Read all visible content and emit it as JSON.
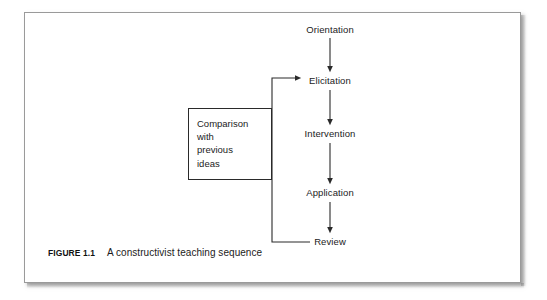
{
  "figure": {
    "caption_number": "FIGURE 1.1",
    "caption_text": "A constructivist teaching sequence",
    "frame_border_color": "#9a9a9a",
    "line_color": "#2a2a2a",
    "text_color": "#1b1b1b",
    "background_color": "#ffffff"
  },
  "diagram": {
    "type": "flowchart",
    "orientation": "vertical",
    "nodes": [
      {
        "id": "orientation",
        "label": "Orientation",
        "x": 330,
        "y": 30
      },
      {
        "id": "elicitation",
        "label": "Elicitation",
        "x": 330,
        "y": 81
      },
      {
        "id": "intervention",
        "label": "Intervention",
        "x": 330,
        "y": 134
      },
      {
        "id": "application",
        "label": "Application",
        "x": 330,
        "y": 193
      },
      {
        "id": "review",
        "label": "Review",
        "x": 330,
        "y": 242
      }
    ],
    "edges": [
      {
        "from": "orientation",
        "to": "elicitation",
        "style": "arrow-down"
      },
      {
        "from": "elicitation",
        "to": "intervention",
        "style": "arrow-down"
      },
      {
        "from": "intervention",
        "to": "application",
        "style": "arrow-down"
      },
      {
        "from": "application",
        "to": "review",
        "style": "arrow-down"
      },
      {
        "from": "review",
        "to": "elicitation",
        "style": "feedback-loop-left"
      }
    ],
    "comparison_box": {
      "label_lines": [
        "Comparison",
        "with",
        "previous",
        "ideas"
      ],
      "x": 188,
      "y": 108,
      "width": 84,
      "height": 72
    }
  }
}
